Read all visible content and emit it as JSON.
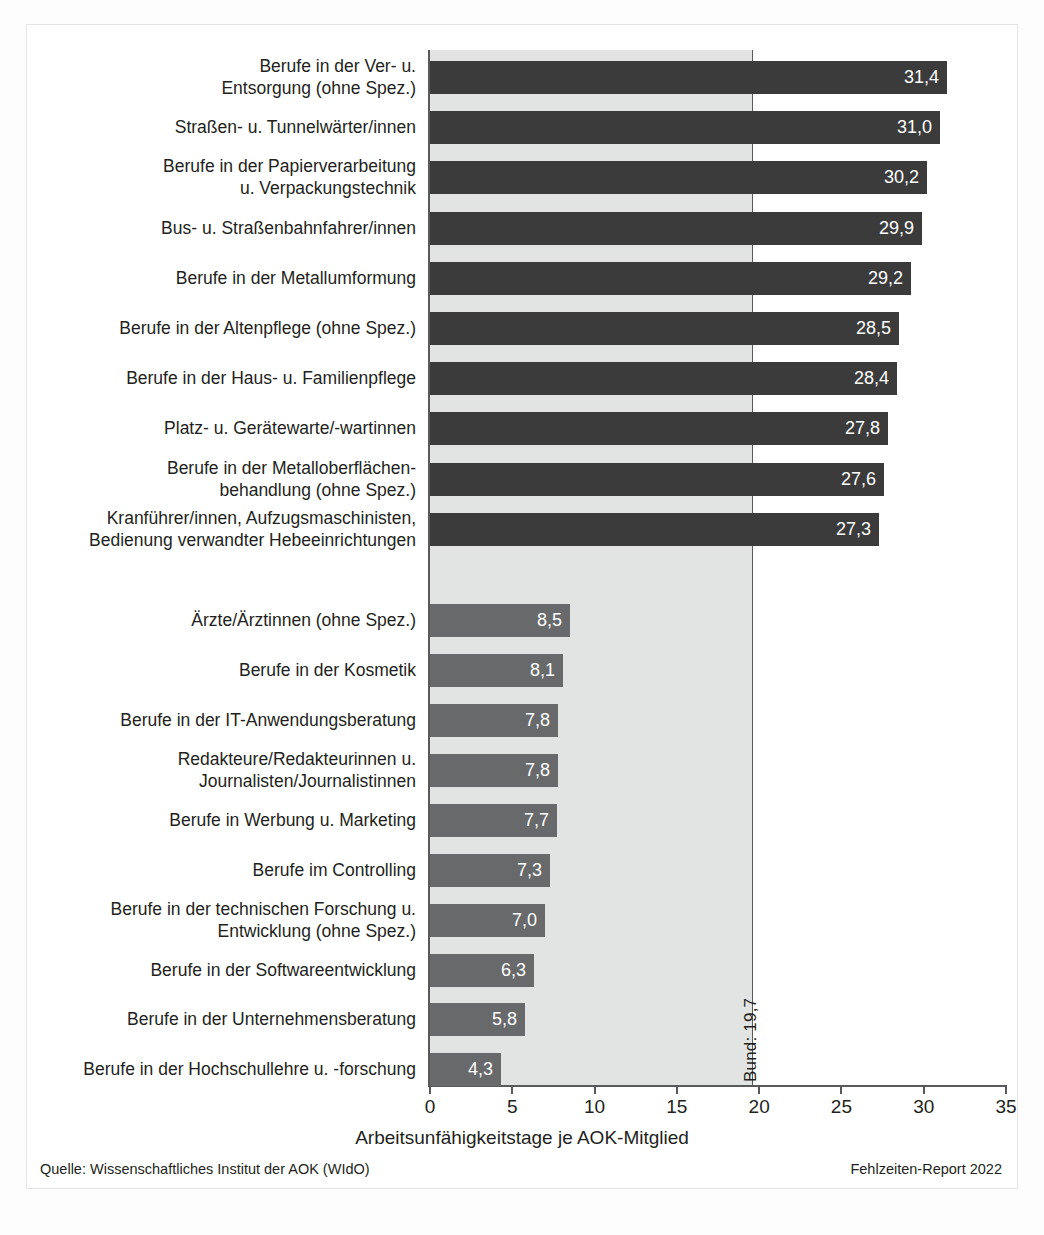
{
  "chart_data": {
    "type": "bar",
    "orientation": "horizontal",
    "title": "",
    "xlabel": "Arbeitsunfähigkeitstage je AOK-Mitglied",
    "ylabel": "",
    "xlim": [
      0,
      35
    ],
    "xticks": [
      0,
      5,
      10,
      15,
      20,
      25,
      30,
      35
    ],
    "xtick_labels": [
      "0",
      "5",
      "10",
      "15",
      "20",
      "25",
      "30",
      "35"
    ],
    "grid": false,
    "legend": null,
    "reference_line": {
      "label": "Bund: 19,7",
      "value": 19.7,
      "orientation": "vertical"
    },
    "categories": [
      "Berufe in der Ver- u.\nEntsorgung (ohne Spez.)",
      "Straßen- u. Tunnelwärter/innen",
      "Berufe in der Papierverarbeitung\nu. Verpackungstechnik",
      "Bus- u. Straßenbahnfahrer/innen",
      "Berufe in der Metallumformung",
      "Berufe in der Altenpflege (ohne Spez.)",
      "Berufe in der Haus- u. Familienpflege",
      "Platz- u. Gerätewarte/-wartinnen",
      "Berufe in der Metalloberflächen-\nbehandlung (ohne Spez.)",
      "Kranführer/innen, Aufzugsmaschinisten,\nBedienung verwandter Hebeeinrichtungen",
      "Ärzte/Ärztinnen (ohne Spez.)",
      "Berufe in der Kosmetik",
      "Berufe in der IT-Anwendungsberatung",
      "Redakteure/Redakteurinnen u.\nJournalisten/Journalistinnen",
      "Berufe in Werbung u. Marketing",
      "Berufe im Controlling",
      "Berufe in der technischen Forschung u.\nEntwicklung (ohne Spez.)",
      "Berufe in der Softwareentwicklung",
      "Berufe in der Unternehmensberatung",
      "Berufe in der Hochschullehre u. -forschung"
    ],
    "values": [
      31.4,
      31.0,
      30.2,
      29.9,
      29.2,
      28.5,
      28.4,
      27.8,
      27.6,
      27.3,
      8.5,
      8.1,
      7.8,
      7.8,
      7.7,
      7.3,
      7.0,
      6.3,
      5.8,
      4.3
    ],
    "value_labels": [
      "31,4",
      "31,0",
      "30,2",
      "29,9",
      "29,2",
      "28,5",
      "28,4",
      "27,8",
      "27,6",
      "27,3",
      "8,5",
      "8,1",
      "7,8",
      "7,8",
      "7,7",
      "7,3",
      "7,0",
      "6,3",
      "5,8",
      "4,3"
    ],
    "groups": [
      "high",
      "high",
      "high",
      "high",
      "high",
      "high",
      "high",
      "high",
      "high",
      "high",
      "low",
      "low",
      "low",
      "low",
      "low",
      "low",
      "low",
      "low",
      "low",
      "low"
    ],
    "colors": {
      "high": "#3b3b3b",
      "low": "#68696b",
      "band": "#e2e3e3",
      "axis": "#58595b",
      "value_text": "#ffffff"
    }
  },
  "footer": {
    "source": "Quelle: Wissenschaftliches Institut der AOK (WIdO)",
    "report": "Fehlzeiten-Report 2022"
  }
}
